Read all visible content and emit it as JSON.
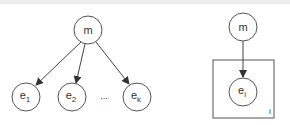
{
  "left_diagram": {
    "root": {
      "label": "m"
    },
    "children": [
      {
        "base": "e",
        "sub": "1"
      },
      {
        "base": "e",
        "sub": "2"
      },
      {
        "ellipsis": "..."
      },
      {
        "base": "e",
        "sub": "k"
      }
    ]
  },
  "right_diagram": {
    "root": {
      "label": "m"
    },
    "child": {
      "base": "e",
      "sub": "i"
    },
    "plate_label": "i"
  },
  "colors": {
    "stroke": "#555555",
    "text": "#333333",
    "background": "#ffffff"
  }
}
